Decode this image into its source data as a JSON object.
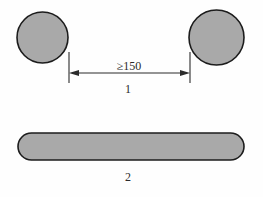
{
  "figure": {
    "background_color": "#fefefe",
    "part_fill_color": "#a9a9a9",
    "outline_color": "#1c1c1c",
    "annotation_color": "#2b2b2b"
  },
  "views": [
    {
      "id": "view-1",
      "caption": "1",
      "description": "Two circular cross-sections separated by a dimensioned gap",
      "shapes": [
        {
          "name": "left-circle",
          "type": "circle",
          "cx": 42.5,
          "cy": 37.5,
          "r": 25.5
        },
        {
          "name": "right-circle",
          "type": "circle",
          "cx": 216.5,
          "cy": 37.5,
          "r": 27.5
        }
      ],
      "dimension": {
        "name": "gap-dimension",
        "text": "≥150",
        "value": "150",
        "relation": "≥",
        "x_start": 69,
        "x_end": 190,
        "y": 73,
        "ext_y_top": 52,
        "ext_y_bottom": 83
      }
    },
    {
      "id": "view-2",
      "caption": "2",
      "description": "Side elevation of a long bar with rounded ends",
      "shapes": [
        {
          "name": "rounded-bar",
          "type": "rounded-rect",
          "x": 18,
          "y": 133,
          "width": 226,
          "height": 27,
          "radius": 13.5
        }
      ]
    }
  ],
  "captions": {
    "view1_label": "1",
    "view1_label_x": 128,
    "view1_label_y": 93,
    "view2_label": "2",
    "view2_label_x": 128,
    "view2_label_y": 181
  },
  "dimension_label": {
    "text": "≥150",
    "x": 129,
    "y": 70
  }
}
